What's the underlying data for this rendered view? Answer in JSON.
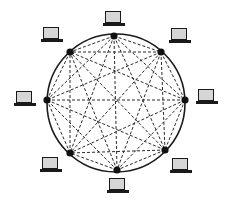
{
  "diagram": {
    "type": "mesh-network-topology",
    "ring": {
      "cx": 116,
      "cy": 103,
      "r": 69,
      "stroke": "#1a1a1a"
    },
    "link_color": "#2a2a2a",
    "node_color": "#111111",
    "nodes": [
      {
        "id": "top",
        "x": 114,
        "y": 36,
        "laptop_x": 103,
        "laptop_y": 11
      },
      {
        "id": "top-right",
        "x": 161,
        "y": 52,
        "laptop_x": 169,
        "laptop_y": 28
      },
      {
        "id": "right",
        "x": 185,
        "y": 100,
        "laptop_x": 196,
        "laptop_y": 89
      },
      {
        "id": "bottom-right",
        "x": 165,
        "y": 150,
        "laptop_x": 170,
        "laptop_y": 158
      },
      {
        "id": "bottom",
        "x": 117,
        "y": 170,
        "laptop_x": 107,
        "laptop_y": 178
      },
      {
        "id": "bottom-left",
        "x": 70,
        "y": 153,
        "laptop_x": 40,
        "laptop_y": 157
      },
      {
        "id": "left",
        "x": 47,
        "y": 100,
        "laptop_x": 14,
        "laptop_y": 91
      },
      {
        "id": "top-left",
        "x": 70,
        "y": 52,
        "laptop_x": 41,
        "laptop_y": 27
      }
    ]
  }
}
